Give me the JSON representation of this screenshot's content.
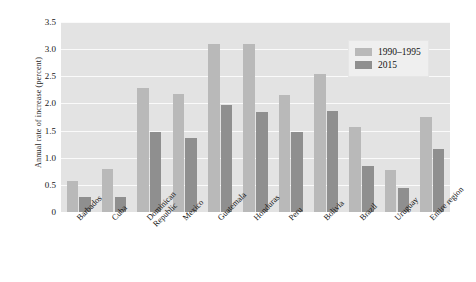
{
  "chart_data": {
    "type": "bar",
    "title": "",
    "xlabel": "",
    "ylabel": "Annual rate of increase (percent)",
    "ylim": [
      0,
      3.5
    ],
    "yticks": [
      "0",
      "0.5",
      "1.0",
      "1.5",
      "2.0",
      "2.5",
      "3.0",
      "3.5"
    ],
    "ytick_values": [
      0,
      0.5,
      1.0,
      1.5,
      2.0,
      2.5,
      3.0,
      3.5
    ],
    "grid": true,
    "legend_position": "top-right",
    "categories": [
      "Barbados",
      "Cuba",
      "Dominican Republic",
      "Mexico",
      "Guatemala",
      "Honduras",
      "Peru",
      "Bolivia",
      "Brazil",
      "Uruguay",
      "Entire region"
    ],
    "category_lines": [
      [
        "Barbados"
      ],
      [
        "Cuba"
      ],
      [
        "Dominican",
        "Republic"
      ],
      [
        "Mexico"
      ],
      [
        "Guatemala"
      ],
      [
        "Honduras"
      ],
      [
        "Peru"
      ],
      [
        "Bolivia"
      ],
      [
        "Brazil"
      ],
      [
        "Uruguay"
      ],
      [
        "Entire region"
      ]
    ],
    "series": [
      {
        "name": "1990–1995",
        "color": "#b9b9b9",
        "values": [
          0.57,
          0.8,
          2.28,
          2.17,
          3.09,
          3.09,
          2.16,
          2.55,
          1.57,
          0.78,
          1.75
        ]
      },
      {
        "name": "2015",
        "color": "#8f8f8f",
        "values": [
          0.27,
          0.27,
          1.48,
          1.37,
          1.97,
          1.85,
          1.48,
          1.86,
          0.85,
          0.45,
          1.17
        ]
      }
    ]
  },
  "style": {
    "plot_background": "#e3e3e3",
    "gridline_color": "#fafafa",
    "legend_background": "#efefef"
  }
}
